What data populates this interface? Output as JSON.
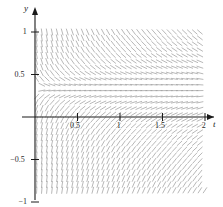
{
  "figure": {
    "kind": "slope-field",
    "background_color": "#ffffff",
    "axis_color": "#1a1a1a",
    "field_color": "#9a9a9a",
    "tick_text_color": "#2b2b2b"
  },
  "axes": {
    "x_axis_label": "t",
    "y_axis_label": "y",
    "x_ticks": [
      {
        "value": 0.5,
        "label": "0.5"
      },
      {
        "value": 1,
        "label": "1"
      },
      {
        "value": 1.5,
        "label": "1.5"
      },
      {
        "value": 2,
        "label": "2"
      }
    ],
    "y_ticks": [
      {
        "value": 1,
        "label": "1"
      },
      {
        "value": 0.5,
        "label": "0.5"
      },
      {
        "value": -0.5,
        "label": "−0.5"
      },
      {
        "value": -1,
        "label": "−1"
      }
    ]
  },
  "chart_data": {
    "type": "scatter",
    "title": "",
    "xlabel": "t",
    "ylabel": "y",
    "xlim": [
      0,
      2
    ],
    "ylim": [
      -1,
      1
    ],
    "grid": false,
    "legend": "none",
    "xticks": [
      0.5,
      1,
      1.5,
      2
    ],
    "xticklabels": [
      "0.5",
      "1",
      "1.5",
      "2"
    ],
    "yticks": [
      1,
      0.5,
      -0.5,
      -1
    ],
    "yticklabels": [
      "1",
      "0.5",
      "−0.5",
      "−1"
    ],
    "field": {
      "description": "direction field of a first order ODE dy/dt = f(t,y); short line segments drawn on a lattice over the window",
      "nx": 34,
      "ny": 30,
      "x_start": 0.02,
      "x_end": 2.0,
      "y_start": -1.0,
      "y_end": 1.0,
      "segment_length_px": 7,
      "nullcline_y": 0.33,
      "notes": [
        "segments are nearly horizontal in a narrow band just above y = 0.3",
        "segments become steeply negative (near vertical) for y < 0 and small t",
        "segments are uniformly down-right diagonal for y > 0.4 across all t",
        "slope magnitude decreases as t increases"
      ]
    }
  }
}
